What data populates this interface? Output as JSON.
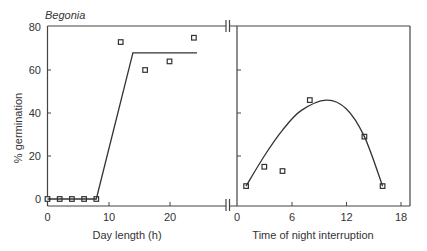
{
  "chart_data": [
    {
      "panel": "left",
      "type": "line",
      "title": "Begonia",
      "xlabel": "Day length (h)",
      "ylabel": "% germination",
      "xlim": [
        0,
        25
      ],
      "ylim": [
        0,
        80
      ],
      "xticks": [
        0,
        10,
        20
      ],
      "yticks": [
        0,
        20,
        40,
        60,
        80
      ],
      "grid": false,
      "series": [
        {
          "name": "observed",
          "marker": "square",
          "x": [
            0,
            2,
            4,
            6,
            8,
            12,
            16,
            20,
            24
          ],
          "y": [
            0,
            0,
            0,
            0,
            0,
            73,
            60,
            64,
            75
          ]
        },
        {
          "name": "fit",
          "style": "line",
          "x": [
            0,
            8,
            14,
            24.5
          ],
          "y": [
            0,
            0,
            68,
            68
          ]
        }
      ]
    },
    {
      "panel": "right",
      "type": "scatter",
      "title": "",
      "xlabel": "Time of night interruption",
      "ylabel": "% germination",
      "xlim": [
        0,
        19
      ],
      "ylim": [
        0,
        80
      ],
      "xticks": [
        0,
        6,
        12,
        18
      ],
      "yticks": [
        0,
        20,
        40,
        60,
        80
      ],
      "grid": false,
      "series": [
        {
          "name": "observed",
          "marker": "square",
          "x": [
            1,
            3,
            5,
            8,
            14,
            16
          ],
          "y": [
            6,
            15,
            13,
            46,
            29,
            6
          ]
        },
        {
          "name": "fitted curve",
          "style": "smooth",
          "x": [
            1,
            3,
            5,
            7,
            9.8,
            12,
            14,
            16
          ],
          "y": [
            6,
            20,
            32,
            41,
            46,
            42,
            29,
            6
          ]
        }
      ]
    }
  ],
  "labels": {
    "title": "Begonia",
    "ylabel": "% germination",
    "left_xlabel": "Day length (h)",
    "right_xlabel": "Time of night interruption",
    "y_ticks": [
      "0",
      "20",
      "40",
      "60",
      "80"
    ],
    "left_x_ticks": [
      "0",
      "10",
      "20"
    ],
    "right_x_ticks": [
      "0",
      "6",
      "12",
      "18"
    ]
  }
}
